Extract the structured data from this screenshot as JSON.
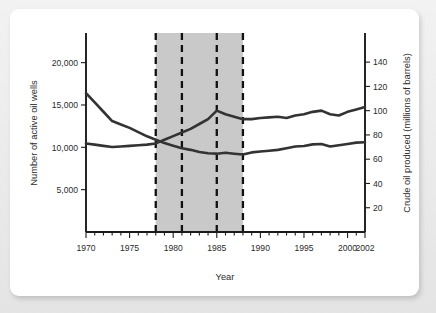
{
  "chart_data": {
    "type": "line",
    "title": "",
    "xlabel": "Year",
    "ylabel": "Number of active oil wells",
    "ylabel_right": "Crude oil produced (millions of barrels)",
    "xlim": [
      1970,
      2002
    ],
    "ylim": [
      0,
      23500
    ],
    "ylim_right": [
      0,
      164
    ],
    "grid": false,
    "legend": "none",
    "xticks_major": [
      1970,
      1975,
      1980,
      1985,
      1990,
      1995,
      2000,
      2002
    ],
    "xtick_labels": [
      "1970",
      "1975",
      "1980",
      "1985",
      "1990",
      "1995",
      "2000",
      "2002"
    ],
    "xticks_minor_step": 1,
    "yticks_left": [
      5000,
      10000,
      15000,
      20000
    ],
    "ytick_labels_left": [
      "5,000",
      "10,000",
      "15,000",
      "20,000"
    ],
    "yticks_right": [
      20,
      40,
      60,
      80,
      100,
      120,
      140
    ],
    "ytick_labels_right": [
      "20",
      "40",
      "60",
      "80",
      "100",
      "120",
      "140"
    ],
    "shaded_band": {
      "start": 1978,
      "end": 1988,
      "color": "#c9c9c9"
    },
    "event_lines": [
      1978,
      1981,
      1985,
      1988
    ],
    "x": [
      1970,
      1971,
      1972,
      1973,
      1974,
      1975,
      1976,
      1977,
      1978,
      1979,
      1980,
      1981,
      1982,
      1983,
      1984,
      1985,
      1986,
      1987,
      1988,
      1989,
      1990,
      1991,
      1992,
      1993,
      1994,
      1995,
      1996,
      1997,
      1998,
      1999,
      2000,
      2001,
      2002
    ],
    "series": [
      {
        "name": "Number of active oil wells",
        "axis": "left",
        "values": [
          16400,
          15300,
          14200,
          13100,
          12700,
          12300,
          11800,
          11300,
          10900,
          10500,
          10200,
          9900,
          9700,
          9450,
          9300,
          9250,
          9350,
          9250,
          9150,
          9400,
          9500,
          9600,
          9700,
          9900,
          10100,
          10150,
          10350,
          10400,
          10100,
          10250,
          10400,
          10550,
          10600
        ]
      },
      {
        "name": "Crude oil produced (millions of barrels)",
        "axis": "right",
        "values": [
          73,
          72,
          71,
          70,
          70.5,
          71,
          71.5,
          72,
          73,
          76,
          79,
          82,
          85,
          89,
          93,
          100,
          97,
          95,
          93,
          93,
          94,
          94.5,
          95,
          94,
          96,
          97,
          99,
          100,
          97,
          96,
          99,
          101,
          103
        ]
      }
    ],
    "series_display": [
      {
        "name": "oil-wells-line",
        "points_left_scale": [
          16400,
          15300,
          14200,
          13100,
          12700,
          12300,
          11800,
          11300,
          10900,
          10500,
          10200,
          9900,
          9700,
          9450,
          9300,
          9250,
          9350,
          9250,
          9150,
          9400,
          9500,
          9600,
          9700,
          9900,
          10100,
          10150,
          10350,
          10400,
          10100,
          10250,
          10400,
          10550,
          10600
        ]
      },
      {
        "name": "crude-oil-line",
        "points_right_scale": [
          73,
          72,
          71,
          70,
          70.5,
          71,
          71.5,
          72,
          73,
          76,
          79,
          82,
          85,
          89,
          93,
          100,
          97,
          95,
          93,
          93,
          94,
          94.5,
          95,
          94,
          96,
          97,
          99,
          100,
          97,
          96,
          99,
          101,
          103
        ]
      }
    ],
    "colors": {
      "line": "#333333",
      "band": "#c9c9c9",
      "axis": "#1b1b1b",
      "panel": "#ffffff",
      "background": "#e9e9e9"
    }
  }
}
